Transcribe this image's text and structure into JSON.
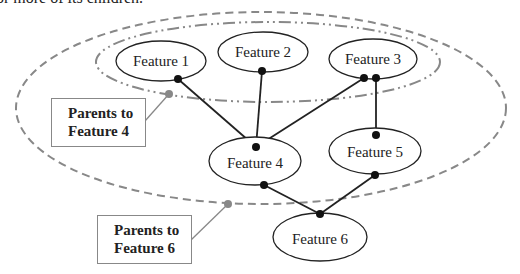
{
  "caption": "or more of its children.",
  "colors": {
    "node_stroke": "#222222",
    "edge": "#222222",
    "group_stroke": "#888888",
    "marker_gray": "#888888"
  },
  "nodes": [
    {
      "id": "f1",
      "label": "Feature 1",
      "cx": 161,
      "cy": 61,
      "rx": 45,
      "ry": 20
    },
    {
      "id": "f2",
      "label": "Feature 2",
      "cx": 263,
      "cy": 52,
      "rx": 45,
      "ry": 20
    },
    {
      "id": "f3",
      "label": "Feature 3",
      "cx": 373,
      "cy": 59,
      "rx": 44,
      "ry": 20
    },
    {
      "id": "f4",
      "label": "Feature 4",
      "cx": 255,
      "cy": 161,
      "rx": 46,
      "ry": 24
    },
    {
      "id": "f5",
      "label": "Feature 5",
      "cx": 375,
      "cy": 151,
      "rx": 46,
      "ry": 23
    },
    {
      "id": "f6",
      "label": "Feature 6",
      "cx": 320,
      "cy": 237,
      "rx": 47,
      "ry": 24
    }
  ],
  "edges": [
    {
      "from": "f1",
      "to": "f4"
    },
    {
      "from": "f2",
      "to": "f4"
    },
    {
      "from": "f3",
      "to": "f4"
    },
    {
      "from": "f3",
      "to": "f5"
    },
    {
      "from": "f4",
      "to": "f6"
    },
    {
      "from": "f5",
      "to": "f6"
    }
  ],
  "groups": [
    {
      "id": "parents-f4",
      "style": "dash-dot",
      "label_line1": "Parents to",
      "label_line2": "Feature 4"
    },
    {
      "id": "parents-f6",
      "style": "dashed",
      "label_line1": "Parents to",
      "label_line2": "Feature 6"
    }
  ]
}
